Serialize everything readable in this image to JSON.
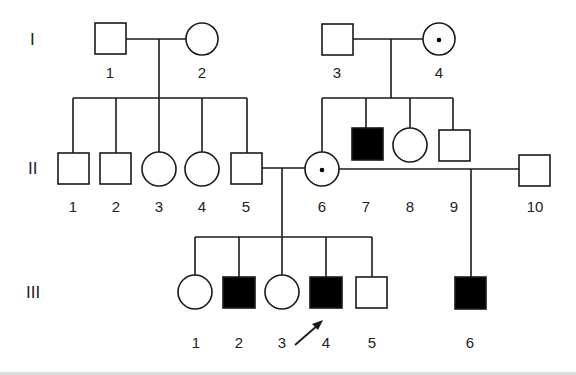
{
  "diagram": {
    "type": "pedigree",
    "generations": [
      {
        "label": "I",
        "members": [
          {
            "id": "I-1",
            "number": "1",
            "sex": "male",
            "status": "unaffected"
          },
          {
            "id": "I-2",
            "number": "2",
            "sex": "female",
            "status": "unaffected"
          },
          {
            "id": "I-3",
            "number": "3",
            "sex": "male",
            "status": "unaffected"
          },
          {
            "id": "I-4",
            "number": "4",
            "sex": "female",
            "status": "carrier"
          }
        ]
      },
      {
        "label": "II",
        "members": [
          {
            "id": "II-1",
            "number": "1",
            "sex": "male",
            "status": "unaffected"
          },
          {
            "id": "II-2",
            "number": "2",
            "sex": "male",
            "status": "unaffected"
          },
          {
            "id": "II-3",
            "number": "3",
            "sex": "female",
            "status": "unaffected"
          },
          {
            "id": "II-4",
            "number": "4",
            "sex": "female",
            "status": "unaffected"
          },
          {
            "id": "II-5",
            "number": "5",
            "sex": "male",
            "status": "unaffected"
          },
          {
            "id": "II-6",
            "number": "6",
            "sex": "female",
            "status": "carrier"
          },
          {
            "id": "II-7",
            "number": "7",
            "sex": "male",
            "status": "affected"
          },
          {
            "id": "II-8",
            "number": "8",
            "sex": "female",
            "status": "unaffected"
          },
          {
            "id": "II-9",
            "number": "9",
            "sex": "male",
            "status": "unaffected"
          },
          {
            "id": "II-10",
            "number": "10",
            "sex": "male",
            "status": "unaffected"
          }
        ]
      },
      {
        "label": "III",
        "members": [
          {
            "id": "III-1",
            "number": "1",
            "sex": "female",
            "status": "unaffected"
          },
          {
            "id": "III-2",
            "number": "2",
            "sex": "male",
            "status": "affected"
          },
          {
            "id": "III-3",
            "number": "3",
            "sex": "female",
            "status": "unaffected"
          },
          {
            "id": "III-4",
            "number": "4",
            "sex": "male",
            "status": "affected",
            "proband": true
          },
          {
            "id": "III-5",
            "number": "5",
            "sex": "male",
            "status": "unaffected"
          },
          {
            "id": "III-6",
            "number": "6",
            "sex": "male",
            "status": "affected"
          }
        ]
      }
    ],
    "unions": [
      {
        "partners": [
          "I-1",
          "I-2"
        ],
        "children": [
          "II-1",
          "II-2",
          "II-3",
          "II-4",
          "II-5"
        ]
      },
      {
        "partners": [
          "I-3",
          "I-4"
        ],
        "children": [
          "II-6",
          "II-7",
          "II-8",
          "II-9"
        ]
      },
      {
        "partners": [
          "II-5",
          "II-6"
        ],
        "children": [
          "III-1",
          "III-2",
          "III-3",
          "III-4",
          "III-5"
        ]
      },
      {
        "partners": [
          "II-6",
          "II-10"
        ],
        "children": [
          "III-6"
        ]
      }
    ],
    "colors": {
      "line": "#1a1a1a",
      "affected_fill": "#000000",
      "unaffected_fill": "#ffffff"
    }
  }
}
